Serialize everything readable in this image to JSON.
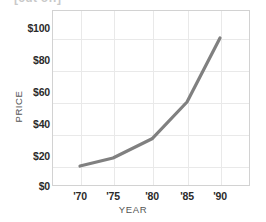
{
  "title_strip": {
    "text": "[cut off]"
  },
  "axes": {
    "ylabel": "PRICE",
    "xlabel": "YEAR"
  },
  "chart_data": {
    "type": "line",
    "title": "",
    "xlabel": "YEAR",
    "ylabel": "PRICE",
    "x": [
      "'70",
      "'75",
      "'80",
      "'85",
      "'90"
    ],
    "values": [
      20,
      25,
      37,
      60,
      100
    ],
    "series": [
      {
        "name": "price",
        "values": [
          20,
          25,
          37,
          60,
          100
        ]
      }
    ],
    "xlim": [
      "'70",
      "'90"
    ],
    "ylim": [
      0,
      110
    ],
    "ytick_labels": [
      "$0",
      "$20",
      "$40",
      "$60",
      "$80",
      "$100"
    ],
    "ytick_values": [
      0,
      20,
      40,
      60,
      80,
      100
    ],
    "xtick_labels": [
      "'70",
      "'75",
      "'80",
      "'85",
      "'90"
    ],
    "grid": true,
    "legend": "none",
    "line_color": "#808080",
    "grid_color": "#e9e9e9",
    "frame_color": "#d2d2d2"
  }
}
